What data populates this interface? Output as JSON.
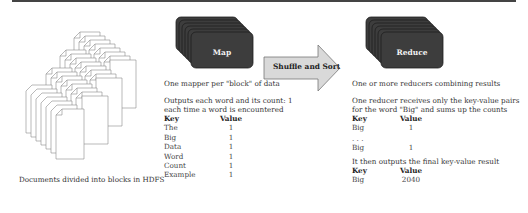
{
  "diagram": {
    "documents": {
      "caption": "Documents divided into blocks in HDFS"
    },
    "map": {
      "box_label": "Map",
      "caption": "One mapper per \"block\" of data",
      "description_line1": "Outputs each word and its count: 1",
      "description_line2": "each time a word is encountered",
      "table": {
        "headers": [
          "Key",
          "Value"
        ],
        "rows": [
          [
            "The",
            "1"
          ],
          [
            "Big",
            "1"
          ],
          [
            "Data",
            "1"
          ],
          [
            "Word",
            "1"
          ],
          [
            "Count",
            "1"
          ],
          [
            "Example",
            "1"
          ]
        ]
      }
    },
    "shuffle": {
      "label": "Shuffle and Sort"
    },
    "reduce": {
      "box_label": "Reduce",
      "caption": "One or more reducers combining results",
      "description_line1": "One reducer receives only the key-value pairs",
      "description_line2": "for the word \"Big\" and sums up the counts",
      "table": {
        "headers": [
          "Key",
          "Value"
        ],
        "rows": [
          [
            "Big",
            "1"
          ],
          [
            ". . .",
            ""
          ],
          [
            "Big",
            "1"
          ]
        ]
      },
      "result_caption": "It then outputs the final key-value result",
      "result_table": {
        "headers": [
          "Key",
          "Value"
        ],
        "rows": [
          [
            "Big",
            "2040"
          ]
        ]
      }
    },
    "colors": {
      "stack_fill": "#3d3d3d",
      "stack_edge": "#222222",
      "arrow_fill": "#d9d9d9",
      "arrow_stroke": "#777777",
      "page_stroke": "#8a8a8a"
    }
  }
}
